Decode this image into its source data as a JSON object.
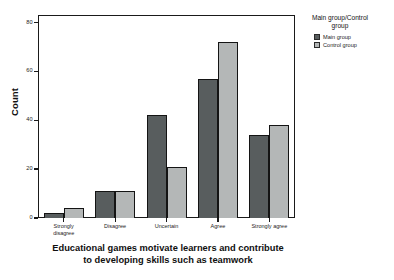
{
  "chart_data": {
    "type": "bar",
    "title": "",
    "xlabel": "Educational games motivate learners and contribute to developing skills such as teamwork",
    "xlabel_line1": "Educational games motivate learners and contribute",
    "xlabel_line2": "to developing skills such as teamwork",
    "ylabel": "Count",
    "categories": [
      "Strongly disagree",
      "Disagree",
      "Uncertain",
      "Agree",
      "Strongly agree"
    ],
    "category_lines": [
      [
        "Strongly",
        "disagree"
      ],
      [
        "Disagree"
      ],
      [
        "Uncertain"
      ],
      [
        "Agree"
      ],
      [
        "Strongly agree"
      ]
    ],
    "series": [
      {
        "name": "Main group",
        "color": "#585d5e",
        "values": [
          2,
          11,
          42,
          57,
          34
        ]
      },
      {
        "name": "Control group",
        "color": "#b4b7b7",
        "values": [
          4,
          11,
          21,
          72,
          38
        ]
      }
    ],
    "ylim": [
      0,
      83
    ],
    "yticks": [
      0,
      20,
      40,
      60,
      80
    ],
    "ytick_labels": [
      "0",
      "20",
      "40",
      "60",
      "80"
    ],
    "grid": false,
    "legend_position": "right",
    "legend_title_line1": "Main group/Control",
    "legend_title_line2": "group"
  },
  "legend": {
    "title": "Main group/Control group",
    "entries": [
      {
        "label": "Main group"
      },
      {
        "label": "Control group"
      }
    ]
  }
}
